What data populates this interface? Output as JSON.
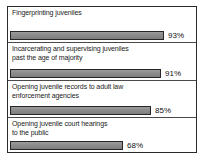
{
  "chart_data": {
    "type": "bar",
    "orientation": "horizontal",
    "title": "",
    "subtitle": "",
    "xlabel": "",
    "ylabel": "",
    "xlim": [
      0,
      100
    ],
    "grid": false,
    "legend": null,
    "value_suffix": "%",
    "categories": [
      "Fingerprinting juveniles",
      "Incarcerating and supervising juveniles\npast the age of majority",
      "Opening juvenile records to adult law\nenforcement agencies",
      "Opening juvenile court hearings\nto the public"
    ],
    "values": [
      93,
      91,
      85,
      68
    ],
    "value_labels": [
      "93%",
      "91%",
      "85%",
      "68%"
    ],
    "bar_color": "#8a8a8a",
    "bar_border_color": "#262626",
    "frame_color": "#2b2b2b",
    "background_color": "#ffffff",
    "text_color": "#1a1a1a"
  },
  "rows": [
    {
      "label": "Fingerprinting juveniles",
      "value": 93,
      "value_label": "93%"
    },
    {
      "label": "Incarcerating and supervising juveniles\npast the age of majority",
      "value": 91,
      "value_label": "91%"
    },
    {
      "label": "Opening juvenile records to adult law\nenforcement agencies",
      "value": 85,
      "value_label": "85%"
    },
    {
      "label": "Opening juvenile court hearings\nto the public",
      "value": 68,
      "value_label": "68%"
    }
  ]
}
